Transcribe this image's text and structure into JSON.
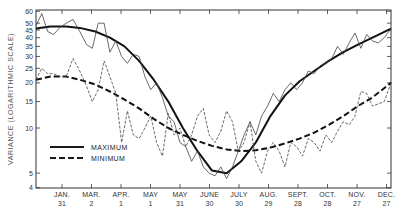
{
  "chart_data": {
    "type": "line",
    "title": "",
    "ylabel": "VARIANCE (LOGARITHMIC SCALE)",
    "xlabel": "",
    "yscale": "log",
    "ylim": [
      4,
      60
    ],
    "grid": false,
    "legend_position": "lower-left",
    "y_ticks": [
      4,
      5,
      10,
      15,
      20,
      25,
      30,
      35,
      40,
      45,
      50,
      60
    ],
    "x_ticks": [
      {
        "month": "JAN.",
        "day": "31"
      },
      {
        "month": "MAR.",
        "day": "2"
      },
      {
        "month": "APR.",
        "day": "1"
      },
      {
        "month": "MAY",
        "day": "1"
      },
      {
        "month": "MAY",
        "day": "31"
      },
      {
        "month": "JUNE",
        "day": "30"
      },
      {
        "month": "JULY",
        "day": "30"
      },
      {
        "month": "AUG.",
        "day": "29"
      },
      {
        "month": "SEPT.",
        "day": "28"
      },
      {
        "month": "OCT.",
        "day": "28"
      },
      {
        "month": "NOV.",
        "day": "27"
      },
      {
        "month": "DEC.",
        "day": "27"
      }
    ],
    "x_domain_days": [
      0,
      365
    ],
    "x_tick_days": [
      31,
      61,
      91,
      121,
      151,
      181,
      211,
      241,
      271,
      301,
      331,
      361
    ],
    "legend": [
      {
        "label": "MAXIMUM",
        "style": "solid"
      },
      {
        "label": "MINIMUM",
        "style": "dashed"
      }
    ],
    "series": [
      {
        "name": "MAXIMUM (smoothed)",
        "style": "solid-thick",
        "x": [
          0,
          15,
          31,
          45,
          61,
          76,
          91,
          106,
          121,
          136,
          151,
          166,
          181,
          196,
          211,
          226,
          241,
          256,
          271,
          286,
          301,
          316,
          331,
          346,
          365
        ],
        "values": [
          46,
          47.5,
          47.5,
          46.5,
          44,
          40,
          35,
          28,
          21,
          15,
          10,
          7,
          5.2,
          5,
          6,
          8,
          12,
          16.5,
          20.5,
          24,
          28,
          32,
          36,
          40,
          46
        ]
      },
      {
        "name": "MAXIMUM (observed)",
        "style": "solid-thin",
        "x": [
          0,
          6,
          12,
          18,
          25,
          31,
          38,
          45,
          52,
          58,
          64,
          70,
          76,
          82,
          88,
          94,
          100,
          106,
          112,
          118,
          124,
          130,
          136,
          142,
          148,
          154,
          160,
          166,
          172,
          178,
          184,
          190,
          196,
          202,
          208,
          214,
          220,
          226,
          232,
          238,
          244,
          250,
          256,
          262,
          268,
          274,
          280,
          286,
          292,
          298,
          304,
          310,
          316,
          322,
          328,
          334,
          340,
          346,
          352,
          358,
          365
        ],
        "values": [
          48,
          58,
          44,
          42,
          47,
          50,
          53,
          44,
          36,
          34,
          50,
          50,
          32,
          38,
          30,
          27,
          31,
          30,
          22,
          18,
          20,
          16,
          12,
          11,
          8,
          7.5,
          6,
          7,
          5.5,
          5,
          4.8,
          5.5,
          4.6,
          5.5,
          7,
          9,
          11,
          9,
          12,
          14,
          17,
          15,
          18,
          20,
          18,
          20,
          24,
          23,
          26,
          27,
          29,
          35,
          31,
          37,
          43,
          34,
          42,
          38,
          37,
          40,
          46
        ]
      },
      {
        "name": "MINIMUM (smoothed)",
        "style": "dashed-thick",
        "x": [
          0,
          15,
          31,
          45,
          61,
          76,
          91,
          106,
          121,
          136,
          151,
          166,
          181,
          196,
          211,
          226,
          241,
          256,
          271,
          286,
          301,
          316,
          331,
          346,
          365
        ],
        "values": [
          21,
          22,
          22,
          21,
          19.5,
          17.5,
          15.5,
          13.5,
          11.5,
          10,
          9,
          8.2,
          7.6,
          7.2,
          7,
          7.1,
          7.4,
          7.9,
          8.5,
          9.3,
          10.5,
          12,
          14,
          16,
          20
        ]
      },
      {
        "name": "MINIMUM (observed)",
        "style": "dashed-thin",
        "x": [
          0,
          6,
          12,
          18,
          25,
          31,
          38,
          45,
          52,
          58,
          64,
          70,
          76,
          82,
          88,
          94,
          100,
          106,
          112,
          118,
          124,
          130,
          136,
          142,
          148,
          154,
          160,
          166,
          172,
          178,
          184,
          190,
          196,
          202,
          208,
          214,
          220,
          226,
          232,
          238,
          244,
          250,
          256,
          262,
          268,
          274,
          280,
          286,
          292,
          298,
          304,
          310,
          316,
          322,
          328,
          334,
          340,
          346,
          352,
          358,
          365
        ],
        "values": [
          21,
          25,
          23,
          23,
          22,
          22,
          29,
          24,
          19,
          15,
          18,
          28,
          22,
          17,
          8,
          13,
          9,
          8.5,
          10,
          12,
          8,
          6.5,
          12.5,
          9,
          10,
          7.5,
          9,
          12,
          13.5,
          9,
          8,
          9.5,
          13,
          11,
          7,
          8,
          11,
          6,
          5,
          7,
          8,
          7,
          5.5,
          8,
          7.5,
          6.5,
          8.5,
          8,
          7,
          9,
          8,
          9.5,
          11,
          10.5,
          12,
          17.5,
          17,
          14,
          14.5,
          15,
          20
        ]
      }
    ]
  },
  "axis": {
    "y_title": "VARIANCE (LOGARITHMIC SCALE)"
  },
  "legend": {
    "max_label": "MAXIMUM",
    "min_label": "MINIMUM"
  }
}
